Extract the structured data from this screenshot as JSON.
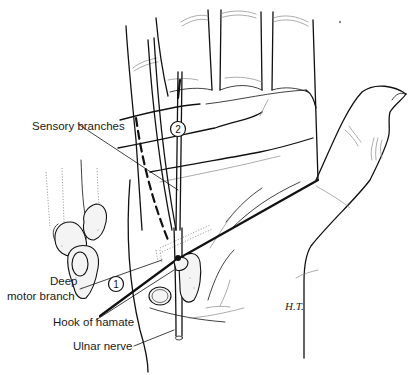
{
  "figure": {
    "type": "anatomical illustration",
    "signature": "H.T."
  },
  "labels": {
    "sensory_branches": "Sensory branches",
    "deep_line1": "Deep",
    "deep_line2": "motor branch",
    "hook_of_hamate": "Hook of hamate",
    "ulnar_nerve": "Ulnar nerve"
  },
  "markers": {
    "marker_1": "1",
    "marker_2": "2"
  },
  "colors": {
    "ink": "#111111",
    "background": "#ffffff"
  }
}
